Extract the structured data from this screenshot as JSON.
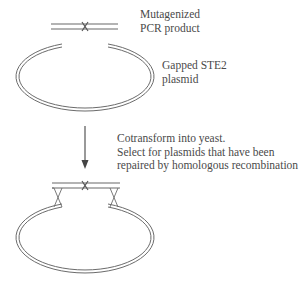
{
  "diagram": {
    "pcr_product_label": [
      "Mutagenized",
      "PCR product"
    ],
    "plasmid_label": [
      "Gapped STE2",
      "plasmid"
    ],
    "step_label": [
      "Cotransform into yeast.",
      "Select for plasmids that have been",
      "repaired by homologous recombination"
    ],
    "colors": {
      "line": "#6b6b6b",
      "dna_strand": "#9a9a9a",
      "text": "#4a4a4a",
      "background": "#ffffff"
    }
  }
}
